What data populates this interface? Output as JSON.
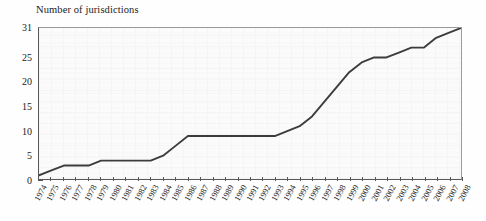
{
  "chart_data": {
    "type": "line",
    "title": "Number of jurisdictions",
    "xlabel": "",
    "ylabel": "Number of jurisdictions",
    "grid": true,
    "legend": false,
    "xlim": [
      1974,
      2008
    ],
    "ylim": [
      0,
      31
    ],
    "ytick_labels": [
      "0",
      "5",
      "10",
      "15",
      "20",
      "25",
      "31"
    ],
    "ytick_values": [
      0,
      5,
      10,
      15,
      20,
      25,
      31
    ],
    "categories": [
      "1974",
      "1975",
      "1976",
      "1977",
      "1978",
      "1979",
      "1980",
      "1981",
      "1982",
      "1983",
      "1984",
      "1985",
      "1986",
      "1987",
      "1988",
      "1989",
      "1990",
      "1991",
      "1992",
      "1993",
      "1994",
      "1995",
      "1996",
      "1997",
      "1998",
      "1999",
      "2000",
      "2001",
      "2002",
      "2003",
      "2004",
      "2005",
      "2006",
      "2007",
      "2008"
    ],
    "x": [
      1974,
      1975,
      1976,
      1977,
      1978,
      1979,
      1980,
      1981,
      1982,
      1983,
      1984,
      1985,
      1986,
      1987,
      1988,
      1989,
      1990,
      1991,
      1992,
      1993,
      1994,
      1995,
      1996,
      1997,
      1998,
      1999,
      2000,
      2001,
      2002,
      2003,
      2004,
      2005,
      2006,
      2007,
      2008
    ],
    "values": [
      1,
      2,
      3,
      3,
      3,
      4,
      4,
      4,
      4,
      4,
      5,
      7,
      9,
      9,
      9,
      9,
      9,
      9,
      9,
      9,
      10,
      11,
      13,
      16,
      19,
      22,
      24,
      25,
      25,
      26,
      27,
      27,
      29,
      30,
      31
    ],
    "series_name": "Cumulative jurisdictions",
    "line_color": "#3c3c3c",
    "background_color": "#fbfbfb",
    "axis_color": "#58585a"
  }
}
